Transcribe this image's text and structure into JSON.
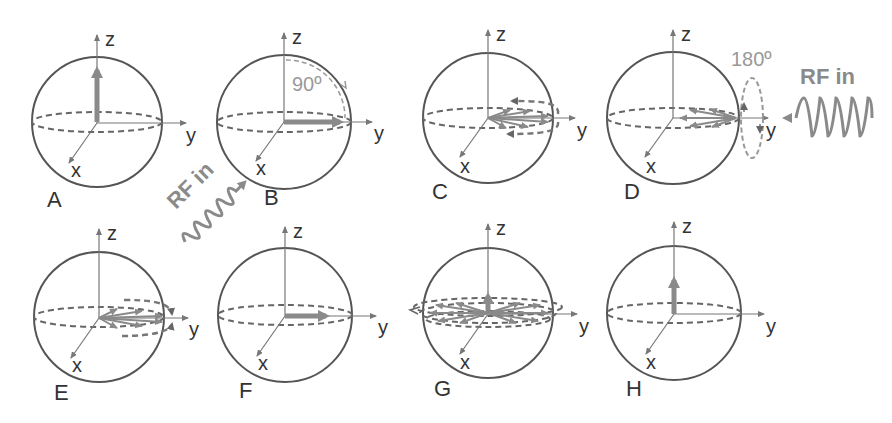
{
  "figure": {
    "panels": [
      {
        "id": "A",
        "label": "A",
        "axes": {
          "z": "z",
          "y": "y",
          "x": "x"
        },
        "state": "net magnetization along +z"
      },
      {
        "id": "B",
        "label": "B",
        "axes": {
          "z": "z",
          "y": "y",
          "x": "x"
        },
        "state": "tipped 90° into transverse plane along y",
        "annotation": "90º"
      },
      {
        "id": "C",
        "label": "C",
        "axes": {
          "z": "z",
          "y": "y",
          "x": "x"
        },
        "state": "spins dephasing in xy-plane"
      },
      {
        "id": "D",
        "label": "D",
        "axes": {
          "z": "z",
          "y": "y",
          "x": "x"
        },
        "state": "180° refocusing pulse applied",
        "annotation": "180º"
      },
      {
        "id": "E",
        "label": "E",
        "axes": {
          "z": "z",
          "y": "y",
          "x": "x"
        },
        "state": "spins rephasing"
      },
      {
        "id": "F",
        "label": "F",
        "axes": {
          "z": "z",
          "y": "y",
          "x": "x"
        },
        "state": "echo - spins realigned along y"
      },
      {
        "id": "G",
        "label": "G",
        "axes": {
          "z": "z",
          "y": "y",
          "x": "x"
        },
        "state": "dephasing with T1 regrowth along z"
      },
      {
        "id": "H",
        "label": "H",
        "axes": {
          "z": "z",
          "y": "y",
          "x": "x"
        },
        "state": "magnetization recovered along +z"
      }
    ],
    "rf_labels": [
      {
        "id": "rf-1",
        "text": "RF in",
        "position": "between A and B, diagonal"
      },
      {
        "id": "rf-2",
        "text": "RF in",
        "position": "right of D"
      }
    ],
    "colors": {
      "sphere": "#555555",
      "vector": "#8a8a8a",
      "annotation": "#999999"
    }
  }
}
